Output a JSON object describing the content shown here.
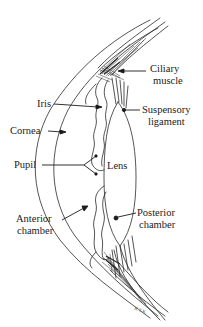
{
  "diagram": {
    "colors": {
      "line": "#2a2a2a",
      "background": "#ffffff",
      "text": "#1a1a1a"
    },
    "labels": {
      "ciliary_muscle": [
        "Ciliary",
        "muscle"
      ],
      "iris": "Iris",
      "suspensory_ligament": [
        "Suspensory",
        "ligament"
      ],
      "cornea": "Cornea",
      "pupil": "Pupil",
      "lens": "Lens",
      "anterior_chamber": [
        "Anterior",
        "chamber"
      ],
      "posterior_chamber": [
        "Posterior",
        "chamber"
      ]
    },
    "signature": "R.T.K."
  }
}
